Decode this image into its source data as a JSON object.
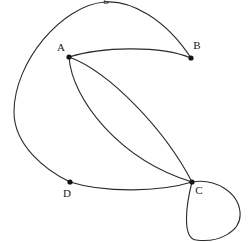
{
  "figure": {
    "name": "directed-multigraph-diagram",
    "background_color": "#ffffff",
    "edge_color": "#2b2b2b",
    "node_color": "#151515",
    "label_color": "#1a1a1a",
    "width": 248,
    "height": 242
  },
  "clipped_title": {
    "text": "g",
    "x": 106,
    "y": 2
  },
  "nodes": [
    {
      "id": "A",
      "label": "A",
      "x": 69,
      "y": 57,
      "label_x": 61,
      "label_y": 48
    },
    {
      "id": "B",
      "label": "B",
      "x": 191,
      "y": 58,
      "label_x": 197,
      "label_y": 46
    },
    {
      "id": "C",
      "label": "C",
      "x": 192,
      "y": 182,
      "label_x": 199,
      "label_y": 191
    },
    {
      "id": "D",
      "label": "D",
      "x": 70,
      "y": 182,
      "label_x": 67,
      "label_y": 194
    }
  ],
  "edges": [
    {
      "name": "edge-top-outer-arc",
      "from": "B",
      "to": "D",
      "path": "M 191 58 C 165 18 130 0 105 2 C 62 5 14 62 14 112 C 14 145 45 170 70 182"
    },
    {
      "name": "edge-a-b",
      "from": "A",
      "to": "B",
      "path": "M 69 57 C 100 47 160 45 191 58"
    },
    {
      "name": "edge-a-c-upper",
      "from": "A",
      "to": "C",
      "path": "M 69 57 C 110 72 165 130 192 182"
    },
    {
      "name": "edge-a-c-lower",
      "from": "A",
      "to": "C",
      "path": "M 69 57 C 72 100 120 160 192 182"
    },
    {
      "name": "edge-d-c",
      "from": "D",
      "to": "C",
      "path": "M 70 182 C 105 193 160 192 192 182"
    },
    {
      "name": "edge-c-self-loop",
      "from": "C",
      "to": "C",
      "path": "M 192 182 C 215 178 238 192 240 212 C 242 232 218 243 196 240 C 182 238 186 205 192 182"
    }
  ]
}
